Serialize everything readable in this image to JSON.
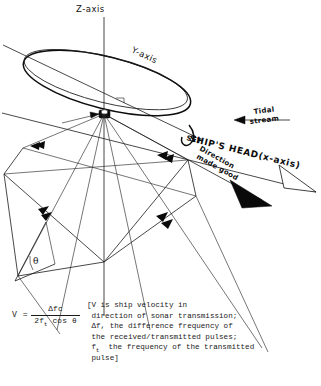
{
  "figure": {
    "background_color": "#ffffff",
    "ink_color": "#111111"
  },
  "axes": {
    "z": {
      "label": "Z-axis"
    },
    "y": {
      "label": "Y-axis"
    },
    "x": {
      "label": "SHIP'S HEAD(x-axis)"
    }
  },
  "vectors": {
    "ships_head": {
      "label": "SHIP'S HEAD(x-axis)",
      "arrowhead": "open"
    },
    "set": {
      "label": "SET"
    },
    "direction_made_good": {
      "label": "Direction\nmade good",
      "line1": "Direction",
      "line2": "made good",
      "arrowhead": "solid"
    },
    "tidal_stream": {
      "label": "Tidal\nstream",
      "line1": "Tidal",
      "line2": "stream",
      "arrowhead": "solid-left"
    }
  },
  "angle": {
    "symbol": "θ",
    "name": "theta-beam-angle"
  },
  "formula": {
    "lhs": "V =",
    "numerator": "Δfc",
    "denominator_pre": "2f",
    "denominator_sub": "t",
    "denominator_post": " cos θ",
    "bracket_lines": [
      "[V is ship velocity in",
      " direction of sonar transmission;",
      " Δf, the difference frequency of",
      " the received/transmitted pulses;",
      " f  the frequency of the transmitted",
      " pulse]"
    ],
    "bracket_subscript_line_index": 4,
    "bracket_subscript": "t",
    "full_text": "V = Δfc / (2f_t cos θ)  [V is ship velocity in direction of sonar transmission; Δf, the difference frequency of the received/transmitted pulses; f_t the frequency of the transmitted pulse]"
  },
  "icons": {
    "transducer": "transducer-block-icon",
    "solid_arrowhead": "solid-arrowhead-icon",
    "open_arrowhead": "open-arrowhead-icon",
    "beam_tick": "beam-direction-tick-icon"
  }
}
